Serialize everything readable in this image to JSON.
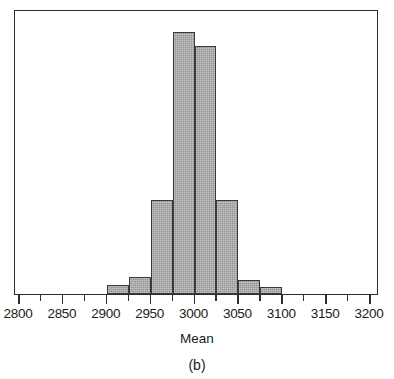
{
  "figure": {
    "panel_label": "(b)",
    "axis_title": "Mean",
    "frame_color": "#2e2e2e",
    "bar_fill_color": "#a9a9a9",
    "bar_edge_color": "#3a3a3a",
    "background_color": "#ffffff"
  },
  "chart_data": {
    "type": "bar",
    "title": "",
    "subtitle": "",
    "xlabel": "Mean",
    "ylabel": "",
    "xlim": [
      2800,
      3200
    ],
    "ylim": [
      0,
      100
    ],
    "grid": false,
    "legend": null,
    "annotations": [
      "(b)"
    ],
    "xticks": [
      2800,
      2850,
      2900,
      2950,
      3000,
      3050,
      3100,
      3150,
      3200
    ],
    "xtick_labels": [
      "2800",
      "2850",
      "2900",
      "2950",
      "3000",
      "3050",
      "3100",
      "3150",
      "3200"
    ],
    "minor_xticks": [
      2825,
      2875,
      2925,
      2975,
      3025,
      3075,
      3125,
      3175
    ],
    "yticks": [],
    "ytick_labels": [],
    "bin_width": 25,
    "bin_edges": [
      2900,
      2925,
      2950,
      2975,
      3000,
      3025,
      3050,
      3075,
      3100
    ],
    "categories": [
      "2900-2925",
      "2925-2950",
      "2950-2975",
      "2975-3000",
      "3000-3025",
      "3025-3050",
      "3050-3075",
      "3075-3100"
    ],
    "values": [
      3,
      6,
      33,
      92,
      87,
      33,
      5,
      2.5
    ],
    "bars": [
      {
        "label": "2900-2925",
        "x0": 2900,
        "x1": 2925,
        "value": 3
      },
      {
        "label": "2925-2950",
        "x0": 2925,
        "x1": 2950,
        "value": 6
      },
      {
        "label": "2950-2975",
        "x0": 2950,
        "x1": 2975,
        "value": 33
      },
      {
        "label": "2975-3000",
        "x0": 2975,
        "x1": 3000,
        "value": 92
      },
      {
        "label": "3000-3025",
        "x0": 3000,
        "x1": 3025,
        "value": 87
      },
      {
        "label": "3025-3050",
        "x0": 3025,
        "x1": 3050,
        "value": 33
      },
      {
        "label": "3050-3075",
        "x0": 3050,
        "x1": 3075,
        "value": 5
      },
      {
        "label": "3075-3100",
        "x0": 3075,
        "x1": 3100,
        "value": 2.5
      }
    ]
  }
}
